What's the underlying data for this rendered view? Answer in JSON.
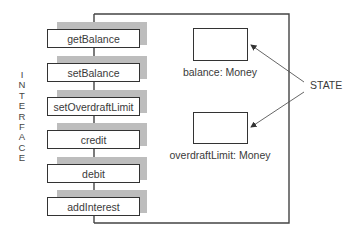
{
  "diagram": {
    "interface_label": "INTERFACE",
    "interface_letters": [
      "I",
      "N",
      "T",
      "E",
      "R",
      "F",
      "A",
      "C",
      "E"
    ],
    "operations": [
      {
        "label": "getBalance"
      },
      {
        "label": "setBalance"
      },
      {
        "label": "setOverdraftLimit"
      },
      {
        "label": "credit"
      },
      {
        "label": "debit"
      },
      {
        "label": "addInterest"
      }
    ],
    "state_fields": [
      {
        "label": "balance: Money"
      },
      {
        "label": "overdraftLimit: Money"
      }
    ],
    "state_annotation": "STATE",
    "colors": {
      "line": "#333333",
      "shadow": "#bdbdbd",
      "text": "#3a3a3a",
      "background": "#ffffff"
    }
  }
}
